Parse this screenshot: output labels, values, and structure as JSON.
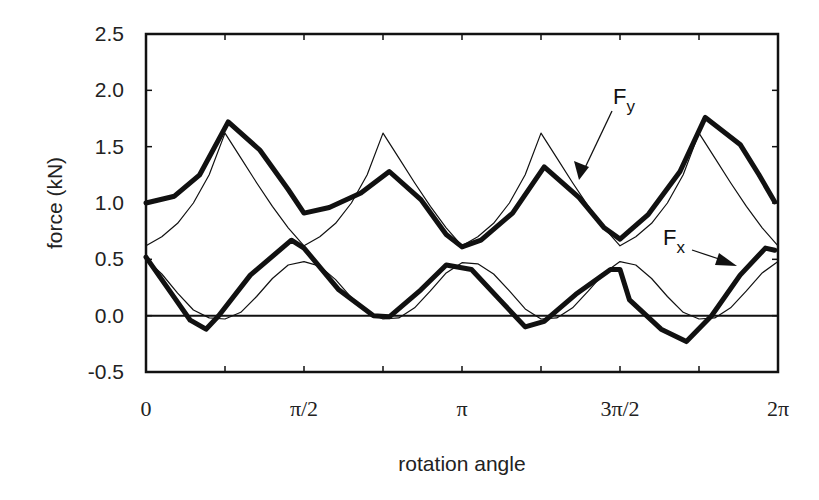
{
  "chart_data": {
    "type": "line",
    "title": "",
    "xlabel": "rotation angle",
    "ylabel": "force (kN)",
    "x_unit": "pi radians",
    "xlim": [
      0,
      2
    ],
    "ylim": [
      -0.5,
      2.5
    ],
    "grid": false,
    "legend": "none",
    "xticks": [
      {
        "value": 0,
        "label": "0"
      },
      {
        "value": 0.5,
        "label": "π/2"
      },
      {
        "value": 1,
        "label": "π"
      },
      {
        "value": 1.5,
        "label": "3π/2"
      },
      {
        "value": 2,
        "label": "2π"
      }
    ],
    "xminor_ticks": [
      0.25,
      0.75,
      1.25,
      1.75
    ],
    "yticks": [
      {
        "value": 2.5,
        "label": "2.5"
      },
      {
        "value": 2.0,
        "label": "2.0"
      },
      {
        "value": 1.5,
        "label": "1.5"
      },
      {
        "value": 1.0,
        "label": "1.0"
      },
      {
        "value": 0.5,
        "label": "0.5"
      },
      {
        "value": 0.0,
        "label": "0.0"
      },
      {
        "value": -0.5,
        "label": "-0.5"
      }
    ],
    "reference_line": {
      "y": 0.0
    },
    "series": [
      {
        "name": "Fy measured",
        "style": "thick",
        "x": [
          0,
          0.09,
          0.17,
          0.26,
          0.36,
          0.45,
          0.5,
          0.58,
          0.68,
          0.77,
          0.87,
          0.95,
          1.0,
          1.06,
          1.16,
          1.26,
          1.37,
          1.45,
          1.5,
          1.59,
          1.69,
          1.77,
          1.88,
          1.94,
          1.99
        ],
        "y": [
          1.0,
          1.06,
          1.25,
          1.72,
          1.47,
          1.12,
          0.91,
          0.96,
          1.09,
          1.28,
          1.03,
          0.72,
          0.61,
          0.67,
          0.91,
          1.32,
          1.05,
          0.78,
          0.68,
          0.9,
          1.28,
          1.76,
          1.52,
          1.25,
          1.01
        ]
      },
      {
        "name": "Fy model",
        "style": "thin",
        "x": [
          0,
          0.05,
          0.1,
          0.15,
          0.2,
          0.25,
          0.3,
          0.35,
          0.4,
          0.45,
          0.5,
          0.55,
          0.6,
          0.65,
          0.7,
          0.75,
          0.8,
          0.85,
          0.9,
          0.95,
          1.0,
          1.05,
          1.1,
          1.15,
          1.2,
          1.25,
          1.3,
          1.35,
          1.4,
          1.45,
          1.5,
          1.55,
          1.6,
          1.65,
          1.7,
          1.75,
          1.8,
          1.85,
          1.9,
          1.95,
          2.0
        ],
        "y": [
          0.62,
          0.7,
          0.82,
          1.0,
          1.25,
          1.62,
          1.4,
          1.18,
          0.97,
          0.78,
          0.62,
          0.7,
          0.82,
          1.0,
          1.25,
          1.62,
          1.4,
          1.18,
          0.97,
          0.78,
          0.62,
          0.7,
          0.82,
          1.0,
          1.25,
          1.62,
          1.4,
          1.18,
          0.97,
          0.78,
          0.62,
          0.7,
          0.82,
          1.0,
          1.25,
          1.62,
          1.4,
          1.18,
          0.97,
          0.78,
          0.62
        ]
      },
      {
        "name": "Fx measured",
        "style": "thick",
        "x": [
          0,
          0.09,
          0.14,
          0.19,
          0.23,
          0.33,
          0.46,
          0.5,
          0.61,
          0.72,
          0.77,
          0.87,
          0.95,
          1.03,
          1.12,
          1.2,
          1.26,
          1.36,
          1.47,
          1.5,
          1.53,
          1.63,
          1.71,
          1.79,
          1.88,
          1.96,
          1.99
        ],
        "y": [
          0.52,
          0.16,
          -0.04,
          -0.12,
          0.0,
          0.36,
          0.67,
          0.6,
          0.23,
          0.0,
          -0.01,
          0.23,
          0.45,
          0.41,
          0.14,
          -0.1,
          -0.05,
          0.19,
          0.41,
          0.41,
          0.14,
          -0.12,
          -0.23,
          0.0,
          0.36,
          0.6,
          0.58
        ]
      },
      {
        "name": "Fx model",
        "style": "thin",
        "x": [
          0,
          0.05,
          0.1,
          0.15,
          0.2,
          0.25,
          0.3,
          0.35,
          0.4,
          0.45,
          0.5,
          0.55,
          0.6,
          0.65,
          0.7,
          0.75,
          0.8,
          0.85,
          0.9,
          0.95,
          1.0,
          1.05,
          1.1,
          1.15,
          1.2,
          1.25,
          1.3,
          1.35,
          1.4,
          1.45,
          1.5,
          1.55,
          1.6,
          1.65,
          1.7,
          1.75,
          1.8,
          1.85,
          1.9,
          1.95,
          2.0
        ],
        "y": [
          0.5,
          0.37,
          0.2,
          0.05,
          -0.02,
          -0.03,
          0.03,
          0.17,
          0.33,
          0.45,
          0.48,
          0.44,
          0.32,
          0.16,
          0.03,
          -0.03,
          -0.02,
          0.07,
          0.22,
          0.38,
          0.47,
          0.46,
          0.37,
          0.22,
          0.06,
          -0.03,
          -0.02,
          0.07,
          0.22,
          0.38,
          0.48,
          0.45,
          0.33,
          0.17,
          0.03,
          -0.03,
          -0.02,
          0.07,
          0.22,
          0.38,
          0.48
        ]
      }
    ],
    "annotations": [
      {
        "label": "F",
        "subscript": "y",
        "points_to": {
          "x": 1.37,
          "y": 1.05
        }
      },
      {
        "label": "F",
        "subscript": "x",
        "points_to": {
          "x": 1.9,
          "y": 0.4
        }
      }
    ]
  }
}
